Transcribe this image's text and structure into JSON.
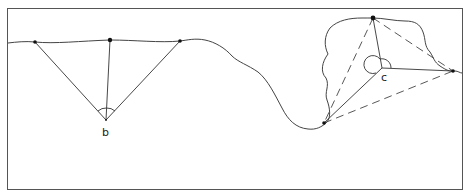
{
  "figure": {
    "type": "survey-triangulation-diagram",
    "colors": {
      "line": "#333333",
      "frame": "#555555",
      "background": "#ffffff"
    }
  },
  "labels": {
    "b": "b",
    "c": "c"
  },
  "panels": [
    {
      "id": "b",
      "description": "Flat terrain: three sighted points on the surface, lines converge at vertex b with angle arcs",
      "vertex": {
        "label": "b",
        "x": 106,
        "y": 120
      },
      "points": [
        {
          "x": 35,
          "y": 42,
          "marker": "star"
        },
        {
          "x": 110,
          "y": 40,
          "marker": "dot"
        },
        {
          "x": 180,
          "y": 41,
          "marker": "star"
        }
      ]
    },
    {
      "id": "c",
      "description": "Overhanging rock outcrop: three points joined to vertex c with solid lines and to each other with dashed lines",
      "vertex": {
        "label": "c",
        "x": 382,
        "y": 68
      },
      "points": [
        {
          "x": 373,
          "y": 18,
          "marker": "dot"
        },
        {
          "x": 324,
          "y": 123,
          "marker": "star"
        },
        {
          "x": 453,
          "y": 71,
          "marker": "star"
        }
      ]
    }
  ]
}
